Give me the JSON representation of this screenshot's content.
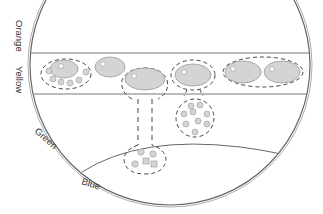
{
  "diagram": {
    "zones": [
      {
        "id": "orange",
        "label": "Orange"
      },
      {
        "id": "yellow",
        "label": "Yellow"
      },
      {
        "id": "green",
        "label": "Green"
      },
      {
        "id": "blue",
        "label": "Blue"
      }
    ],
    "colors": {
      "outline": "#555555",
      "cell_fill": "#d4d4d4",
      "cell_stroke": "#9a9a9a",
      "dash": "#444444",
      "background": "#ffffff"
    }
  }
}
